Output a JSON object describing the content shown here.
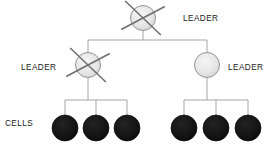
{
  "diagram": {
    "background_color": "#ffffff",
    "colors": {
      "leader_fill": "#e3e3e3",
      "leader_fill_highlight": "#f4f4f4",
      "leader_stroke": "#8a8a8a",
      "cell_fill": "#121212",
      "cell_stroke": "#000000",
      "connector_stroke": "#9b9b9b",
      "cross_stroke": "#6f6f6f",
      "text_color": "#1a1a1a"
    },
    "labels": [
      {
        "id": "leader-top",
        "text": "LEADER",
        "x": 183,
        "y": 21
      },
      {
        "id": "leader-left",
        "text": "LEADER",
        "x": 21,
        "y": 70
      },
      {
        "id": "leader-right",
        "text": "LEADER",
        "x": 228,
        "y": 70
      },
      {
        "id": "cells",
        "text": "CELLS",
        "x": 5,
        "y": 126
      }
    ],
    "leader_nodes": [
      {
        "id": "root-leader",
        "cx": 143,
        "cy": 18,
        "r": 12.5,
        "crossed_out": true,
        "level": "root"
      },
      {
        "id": "left-leader",
        "cx": 88,
        "cy": 65,
        "r": 12.5,
        "crossed_out": true,
        "level": "middle"
      },
      {
        "id": "right-leader",
        "cx": 207,
        "cy": 65,
        "r": 12.5,
        "crossed_out": false,
        "level": "middle"
      }
    ],
    "cell_nodes": [
      {
        "id": "cell-1",
        "cx": 65,
        "cy": 128,
        "r": 13,
        "group": "left"
      },
      {
        "id": "cell-2",
        "cx": 96,
        "cy": 128,
        "r": 13,
        "group": "left"
      },
      {
        "id": "cell-3",
        "cx": 127,
        "cy": 128,
        "r": 13,
        "group": "left"
      },
      {
        "id": "cell-4",
        "cx": 184,
        "cy": 128,
        "r": 13,
        "group": "right"
      },
      {
        "id": "cell-5",
        "cx": 216,
        "cy": 128,
        "r": 13,
        "group": "right"
      },
      {
        "id": "cell-6",
        "cx": 248,
        "cy": 128,
        "r": 13,
        "group": "right"
      }
    ],
    "connectors": [
      {
        "id": "root-stem",
        "type": "vertical",
        "x": 143,
        "y1": 30,
        "y2": 40
      },
      {
        "id": "root-bus",
        "type": "horizontal",
        "y": 40,
        "x1": 88,
        "x2": 207
      },
      {
        "id": "left-leader-drop",
        "type": "vertical",
        "x": 88,
        "y1": 40,
        "y2": 52
      },
      {
        "id": "right-leader-drop",
        "type": "vertical",
        "x": 207,
        "y1": 40,
        "y2": 52
      },
      {
        "id": "left-leader-stem",
        "type": "vertical",
        "x": 88,
        "y1": 78,
        "y2": 100
      },
      {
        "id": "right-leader-stem",
        "type": "vertical",
        "x": 207,
        "y1": 78,
        "y2": 100
      },
      {
        "id": "left-cell-bus",
        "type": "horizontal",
        "y": 100,
        "x1": 65,
        "x2": 127
      },
      {
        "id": "right-cell-bus",
        "type": "horizontal",
        "y": 100,
        "x1": 184,
        "x2": 248
      },
      {
        "id": "cell-1-stem",
        "type": "vertical",
        "x": 65,
        "y1": 100,
        "y2": 116
      },
      {
        "id": "cell-2-stem",
        "type": "vertical",
        "x": 96,
        "y1": 100,
        "y2": 116
      },
      {
        "id": "cell-3-stem",
        "type": "vertical",
        "x": 127,
        "y1": 100,
        "y2": 116
      },
      {
        "id": "cell-4-stem",
        "type": "vertical",
        "x": 184,
        "y1": 100,
        "y2": 116
      },
      {
        "id": "cell-5-stem",
        "type": "vertical",
        "x": 216,
        "y1": 100,
        "y2": 116
      },
      {
        "id": "cell-6-stem",
        "type": "vertical",
        "x": 248,
        "y1": 100,
        "y2": 116
      }
    ],
    "cross_marks": [
      {
        "id": "cross-root",
        "cx": 143,
        "cy": 18,
        "half": 20,
        "rotation": 8
      },
      {
        "id": "cross-left-leader",
        "cx": 88,
        "cy": 65,
        "half": 20,
        "rotation": 8
      }
    ]
  }
}
